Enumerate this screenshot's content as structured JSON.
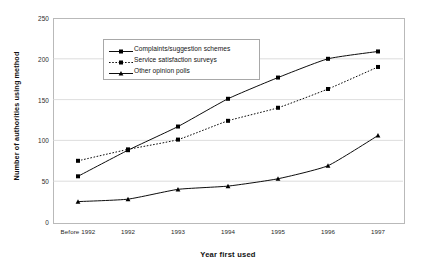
{
  "chart_data": {
    "type": "line",
    "title": "",
    "xlabel": "Year first used",
    "ylabel": "Number of authorities using method",
    "categories": [
      "Before 1992",
      "1992",
      "1993",
      "1994",
      "1995",
      "1996",
      "1997"
    ],
    "ylim": [
      0,
      250
    ],
    "yticks": [
      0,
      50,
      100,
      150,
      200,
      250
    ],
    "ytick_labels": [
      "0",
      "50",
      "100",
      "150",
      "200",
      "250"
    ],
    "grid": "horizontal",
    "legend_position": "inside-upper-left",
    "series": [
      {
        "name": "Complaints/suggestion schemes",
        "values": [
          56,
          88,
          117,
          151,
          177,
          200,
          209
        ],
        "marker": "square",
        "line_style": "solid",
        "color": "#000000"
      },
      {
        "name": "Service satisfaction surveys",
        "values": [
          75,
          89,
          101,
          124,
          140,
          163,
          190
        ],
        "marker": "square",
        "line_style": "dotted",
        "color": "#000000"
      },
      {
        "name": "Other opinion polls",
        "values": [
          25,
          28,
          40,
          44,
          53,
          69,
          106
        ],
        "marker": "triangle",
        "line_style": "solid",
        "color": "#000000"
      }
    ]
  },
  "colors": {
    "background": "#ffffff",
    "gridline": "#d4d4d4",
    "plot_border": "#b9b9b9",
    "text": "#1a1a1a"
  }
}
